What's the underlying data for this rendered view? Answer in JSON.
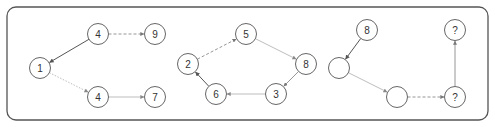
{
  "diagram": {
    "frame": {
      "x": 7,
      "y": 7,
      "width": 481,
      "height": 113,
      "radius": 9
    },
    "node_radius": 10.5,
    "colors": {
      "dark": "#555555",
      "mid": "#8a8a8a",
      "light": "#b5b5b5"
    },
    "panels": [
      {
        "id": "panel-1",
        "nodes": [
          {
            "id": "p1-n1",
            "label": "1",
            "x": 40,
            "y": 68
          },
          {
            "id": "p1-n4a",
            "label": "4",
            "x": 98,
            "y": 34
          },
          {
            "id": "p1-n9",
            "label": "9",
            "x": 155,
            "y": 34
          },
          {
            "id": "p1-n4b",
            "label": "4",
            "x": 98,
            "y": 97
          },
          {
            "id": "p1-n7",
            "label": "7",
            "x": 155,
            "y": 97
          }
        ],
        "edges": [
          {
            "from": "p1-n4a",
            "to": "p1-n1",
            "style": "solid",
            "tone": "dark"
          },
          {
            "from": "p1-n1",
            "to": "p1-n4b",
            "style": "dotted",
            "tone": "light"
          },
          {
            "from": "p1-n4a",
            "to": "p1-n9",
            "style": "dashed",
            "tone": "mid"
          },
          {
            "from": "p1-n4b",
            "to": "p1-n7",
            "style": "solid",
            "tone": "light"
          }
        ]
      },
      {
        "id": "panel-2",
        "nodes": [
          {
            "id": "p2-n5",
            "label": "5",
            "x": 246,
            "y": 34
          },
          {
            "id": "p2-n2",
            "label": "2",
            "x": 188,
            "y": 64
          },
          {
            "id": "p2-n8",
            "label": "8",
            "x": 306,
            "y": 64
          },
          {
            "id": "p2-n6",
            "label": "6",
            "x": 216,
            "y": 94
          },
          {
            "id": "p2-n3",
            "label": "3",
            "x": 276,
            "y": 94
          }
        ],
        "edges": [
          {
            "from": "p2-n2",
            "to": "p2-n5",
            "style": "dashed",
            "tone": "mid"
          },
          {
            "from": "p2-n5",
            "to": "p2-n8",
            "style": "solid",
            "tone": "light"
          },
          {
            "from": "p2-n8",
            "to": "p2-n3",
            "style": "solid",
            "tone": "mid"
          },
          {
            "from": "p2-n3",
            "to": "p2-n6",
            "style": "solid",
            "tone": "light"
          },
          {
            "from": "p2-n6",
            "to": "p2-n2",
            "style": "solid",
            "tone": "dark"
          }
        ]
      },
      {
        "id": "panel-3",
        "nodes": [
          {
            "id": "p3-n8",
            "label": "8",
            "x": 367,
            "y": 30
          },
          {
            "id": "p3-blank1",
            "label": "",
            "x": 339,
            "y": 68
          },
          {
            "id": "p3-blank2",
            "label": "",
            "x": 397,
            "y": 97
          },
          {
            "id": "p3-q1",
            "label": "?",
            "x": 455,
            "y": 97
          },
          {
            "id": "p3-q2",
            "label": "?",
            "x": 455,
            "y": 30
          }
        ],
        "edges": [
          {
            "from": "p3-n8",
            "to": "p3-blank1",
            "style": "solid",
            "tone": "dark"
          },
          {
            "from": "p3-blank1",
            "to": "p3-blank2",
            "style": "solid",
            "tone": "light"
          },
          {
            "from": "p3-blank2",
            "to": "p3-q1",
            "style": "dashed",
            "tone": "mid"
          },
          {
            "from": "p3-q1",
            "to": "p3-q2",
            "style": "solid",
            "tone": "mid"
          }
        ]
      }
    ]
  }
}
